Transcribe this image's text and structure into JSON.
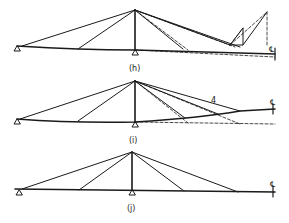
{
  "diagram": {
    "panels": [
      {
        "label": "(h)",
        "centerline": "℄"
      },
      {
        "label": "(i)",
        "centerline": "℄",
        "cable_tag": "4"
      },
      {
        "label": "(j)",
        "centerline": "℄"
      }
    ],
    "colors": {
      "line": "#1a1a1a",
      "background": "#ffffff"
    }
  }
}
